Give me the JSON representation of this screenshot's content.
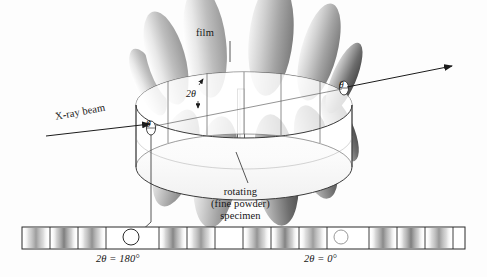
{
  "figure": {
    "background_color": "#fdfdfd",
    "ink_color": "#161616",
    "line_color": "#4a4a4a"
  },
  "labels": {
    "film": "film",
    "specimen_line1": "rotating",
    "specimen_line2": "(fine powder)",
    "specimen_line3": "specimen",
    "xray_beam": "X-ray beam",
    "two_theta": "2θ",
    "theta_left": "θ",
    "theta_right": "θ",
    "two_theta_180": "2θ = 180°",
    "two_theta_0": "2θ = 0°"
  },
  "camera": {
    "description": "Cylindrical film strip encircling a rotating powder specimen rod; diffraction cones intersect the film as arcs.",
    "cylinder": {
      "center_x": 244,
      "center_y": 105,
      "radius_x": 108,
      "radius_y": 33,
      "band_height": 62,
      "segment_divider_count": 8
    },
    "specimen_rod": {
      "x": 241,
      "top_y": 89,
      "bottom_y": 150,
      "width": 7
    },
    "entry_hole": {
      "x": 151,
      "y": 128,
      "label": "θ"
    },
    "exit_hole": {
      "x": 344,
      "y": 88,
      "label": "θ"
    },
    "beam_arrow_in": {
      "x1": 46,
      "y1": 133,
      "x2": 152,
      "y2": 123
    },
    "beam_arrow_out": {
      "x1": 345,
      "y1": 87,
      "x2": 452,
      "y2": 68
    }
  },
  "diffraction_cones": {
    "count": 8,
    "note": "Grey shaded conical lobes radiating from the specimen, upper lobes light, lower lobes dark",
    "upper_lobes": [
      {
        "cx": 166,
        "cy": 58,
        "rx": 19,
        "ry": 48,
        "rot": -16,
        "shade": "light"
      },
      {
        "cx": 205,
        "cy": 42,
        "rx": 21,
        "ry": 56,
        "rot": -7,
        "shade": "light"
      },
      {
        "cx": 271,
        "cy": 38,
        "rx": 22,
        "ry": 58,
        "rot": 6,
        "shade": "mid"
      },
      {
        "cx": 319,
        "cy": 52,
        "rx": 18,
        "ry": 50,
        "rot": 15,
        "shade": "mid"
      }
    ],
    "lower_lobes": [
      {
        "cx": 176,
        "cy": 158,
        "rx": 20,
        "ry": 50,
        "rot": 16,
        "shade": "mid"
      },
      {
        "cx": 216,
        "cy": 172,
        "rx": 22,
        "ry": 56,
        "rot": 7,
        "shade": "mid"
      },
      {
        "cx": 276,
        "cy": 170,
        "rx": 22,
        "ry": 56,
        "rot": -7,
        "shade": "dark"
      },
      {
        "cx": 316,
        "cy": 152,
        "rx": 19,
        "ry": 48,
        "rot": -15,
        "shade": "dark"
      }
    ]
  },
  "film_strip": {
    "x": 22,
    "y": 227,
    "width": 443,
    "height": 22,
    "hole_180": {
      "cx": 131,
      "cy": 237,
      "r": 8
    },
    "hole_0": {
      "cx": 341,
      "cy": 237,
      "r": 7
    },
    "segment_dividers": [
      50,
      78,
      106,
      159,
      187,
      215,
      243,
      271,
      299,
      327,
      369,
      397,
      425,
      453
    ],
    "arcs": [
      {
        "center": 36,
        "width": 26,
        "intensity": 0.55
      },
      {
        "center": 64,
        "width": 26,
        "intensity": 0.72
      },
      {
        "center": 92,
        "width": 26,
        "intensity": 0.62
      },
      {
        "center": 173,
        "width": 26,
        "intensity": 0.68
      },
      {
        "center": 201,
        "width": 26,
        "intensity": 0.58
      },
      {
        "center": 257,
        "width": 26,
        "intensity": 0.6
      },
      {
        "center": 285,
        "width": 26,
        "intensity": 0.7
      },
      {
        "center": 313,
        "width": 26,
        "intensity": 0.55
      },
      {
        "center": 383,
        "width": 26,
        "intensity": 0.66
      },
      {
        "center": 411,
        "width": 26,
        "intensity": 0.72
      },
      {
        "center": 439,
        "width": 26,
        "intensity": 0.58
      }
    ]
  },
  "leader_lines": {
    "film": [
      [
        230,
        42
      ],
      [
        230,
        62
      ]
    ],
    "specimen": [
      [
        250,
        184
      ],
      [
        236,
        152
      ]
    ],
    "hole_to_strip": [
      [
        151,
        132
      ],
      [
        151,
        222
      ],
      [
        138,
        233
      ]
    ]
  }
}
